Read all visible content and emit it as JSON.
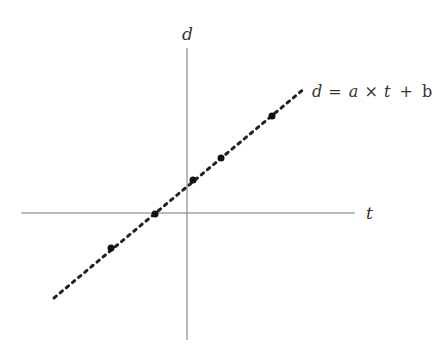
{
  "diagram": {
    "axes": {
      "horizontal_label": "t",
      "vertical_label": "d"
    },
    "line_equation": {
      "lhs": "d",
      "eq": "=",
      "a": "a",
      "times": "×",
      "t": "t",
      "plus": "+",
      "b": "b"
    },
    "points": [
      {
        "x": 111,
        "y": 248
      },
      {
        "x": 155,
        "y": 214
      },
      {
        "x": 193,
        "y": 180
      },
      {
        "x": 221,
        "y": 158
      },
      {
        "x": 272,
        "y": 116
      }
    ],
    "colors": {
      "axis": "#555555",
      "line": "#222222",
      "points": "#111111",
      "text": "#333333"
    }
  }
}
